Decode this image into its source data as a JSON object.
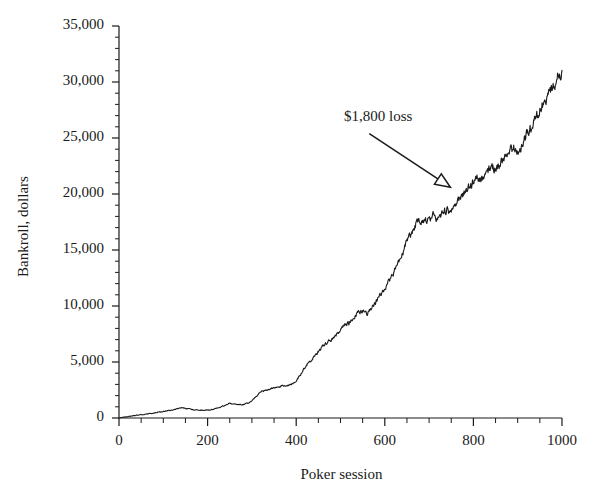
{
  "chart_data": {
    "type": "line",
    "title": "",
    "xlabel": "Poker session",
    "ylabel": "Bankroll, dollars",
    "xlim": [
      0,
      1000
    ],
    "ylim": [
      0,
      35000
    ],
    "xticks": [
      0,
      200,
      400,
      600,
      800,
      1000
    ],
    "xtick_labels": [
      "0",
      "200",
      "400",
      "600",
      "800",
      "1000"
    ],
    "yticks": [
      0,
      5000,
      10000,
      15000,
      20000,
      25000,
      30000,
      35000
    ],
    "ytick_labels": [
      "0",
      "5,000",
      "10,000",
      "15,000",
      "20,000",
      "25,000",
      "30,000",
      "35,000"
    ],
    "x_minor_step": 50,
    "y_minor_step": 1000,
    "grid": false,
    "legend": null,
    "line_color": "#1a1a1a",
    "line_width": 1.1,
    "annotations": [
      {
        "text": "$1,800 loss",
        "text_x": 520,
        "text_y": 26900,
        "arrow_tail_x": 565,
        "arrow_tail_y": 25400,
        "arrow_tip_x": 748,
        "arrow_tip_y": 20600,
        "arrow_head": "open-triangle"
      }
    ],
    "x": [
      0,
      10,
      20,
      30,
      40,
      50,
      60,
      70,
      80,
      90,
      100,
      110,
      120,
      130,
      140,
      150,
      160,
      170,
      180,
      190,
      200,
      210,
      220,
      230,
      240,
      250,
      260,
      270,
      280,
      290,
      300,
      310,
      320,
      330,
      340,
      350,
      360,
      370,
      380,
      390,
      400,
      410,
      420,
      430,
      440,
      450,
      460,
      470,
      480,
      490,
      500,
      510,
      520,
      530,
      540,
      550,
      560,
      570,
      580,
      590,
      600,
      610,
      620,
      630,
      640,
      650,
      660,
      670,
      680,
      690,
      700,
      710,
      720,
      730,
      740,
      750,
      760,
      770,
      780,
      790,
      800,
      810,
      820,
      830,
      840,
      850,
      860,
      870,
      880,
      890,
      900,
      910,
      920,
      930,
      940,
      950,
      960,
      970,
      980,
      990,
      1000
    ],
    "y": [
      0,
      80,
      130,
      190,
      250,
      300,
      340,
      400,
      470,
      530,
      580,
      640,
      700,
      820,
      900,
      870,
      790,
      720,
      700,
      690,
      700,
      760,
      850,
      980,
      1150,
      1300,
      1250,
      1180,
      1200,
      1320,
      1520,
      1900,
      2350,
      2500,
      2600,
      2700,
      2800,
      2850,
      2900,
      3000,
      3350,
      3900,
      4550,
      5050,
      5450,
      5950,
      6450,
      6800,
      7000,
      7350,
      7900,
      8350,
      8450,
      8900,
      9400,
      9600,
      9300,
      9800,
      10350,
      11000,
      11600,
      12250,
      13000,
      13800,
      14700,
      15700,
      16600,
      17300,
      17600,
      17400,
      17900,
      18100,
      17700,
      18400,
      18600,
      18300,
      19100,
      19700,
      20100,
      20600,
      21100,
      21500,
      21300,
      21800,
      22400,
      22100,
      22700,
      23300,
      23900,
      24100,
      23800,
      24500,
      25300,
      26000,
      26800,
      27500,
      28200,
      29000,
      29700,
      30400,
      31000
    ]
  },
  "figure": {
    "plot_left_px": 119,
    "plot_right_px": 562,
    "plot_top_px": 26,
    "plot_bottom_px": 418,
    "background": "#ffffff",
    "axis_color": "#1a1a1a"
  }
}
